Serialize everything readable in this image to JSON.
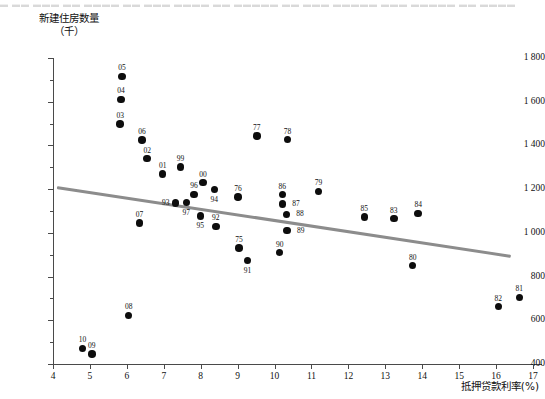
{
  "top_cutoff_text": "▬ ▬▬ ▬▬▬ ▬▬  ▬▬▬▬ ▬▬ ▬▬▬ ▬▬▬▬ ▬▬ ▬▬▬▬▬ ▬▬ ▬▬▬ ▬▬▬▬▬ ▬▬▬ ▬▬▬▬▬ ▬▬  ▬▬▬▬",
  "chart_data": {
    "type": "scatter",
    "title": "",
    "ylabel_line1": "新建住房数量",
    "ylabel_line2": "（千）",
    "xlabel": "抵押贷款利率(%)",
    "xlim": [
      4,
      17
    ],
    "ylim": [
      400,
      1800
    ],
    "xticks": [
      "4",
      "5",
      "6",
      "7",
      "8",
      "9",
      "10",
      "11",
      "12",
      "13",
      "14",
      "15",
      "16",
      "17"
    ],
    "yticks": [
      "400",
      "600",
      "800",
      "1 000",
      "1 200",
      "1 400",
      "1 600",
      "1 800"
    ],
    "yminor_step": 100,
    "grid": false,
    "legend": "none",
    "point_label_field": "year",
    "trendline": {
      "x0": 4.1,
      "y0": 1215,
      "x1": 16.4,
      "y1": 900,
      "color": "#8c8c8c"
    },
    "point_color": "#0d0d0d",
    "points": [
      {
        "year": "05",
        "x": 5.87,
        "y": 1716,
        "lab": "above"
      },
      {
        "year": "04",
        "x": 5.84,
        "y": 1611,
        "lab": "above"
      },
      {
        "year": "03",
        "x": 5.82,
        "y": 1499,
        "lab": "above"
      },
      {
        "year": "06",
        "x": 6.41,
        "y": 1424,
        "lab": "above"
      },
      {
        "year": "02",
        "x": 6.55,
        "y": 1340,
        "lab": "above"
      },
      {
        "year": "01",
        "x": 6.97,
        "y": 1270,
        "lab": "above"
      },
      {
        "year": "99",
        "x": 7.45,
        "y": 1301,
        "lab": "above"
      },
      {
        "year": "00",
        "x": 8.06,
        "y": 1230,
        "lab": "above"
      },
      {
        "year": "96",
        "x": 7.82,
        "y": 1176,
        "lab": "above"
      },
      {
        "year": "94",
        "x": 8.37,
        "y": 1198,
        "lab": "below"
      },
      {
        "year": "76",
        "x": 9.01,
        "y": 1164,
        "lab": "above"
      },
      {
        "year": "93",
        "x": 7.32,
        "y": 1136,
        "lab": "left"
      },
      {
        "year": "97",
        "x": 7.61,
        "y": 1138,
        "lab": "below"
      },
      {
        "year": "95",
        "x": 7.99,
        "y": 1076,
        "lab": "below"
      },
      {
        "year": "92",
        "x": 8.41,
        "y": 1030,
        "lab": "above"
      },
      {
        "year": "75",
        "x": 9.04,
        "y": 931,
        "lab": "above"
      },
      {
        "year": "91",
        "x": 9.27,
        "y": 873,
        "lab": "below"
      },
      {
        "year": "90",
        "x": 10.14,
        "y": 910,
        "lab": "above"
      },
      {
        "year": "86",
        "x": 10.21,
        "y": 1175,
        "lab": "above"
      },
      {
        "year": "87",
        "x": 10.21,
        "y": 1132,
        "lab": "right"
      },
      {
        "year": "88",
        "x": 10.32,
        "y": 1085,
        "lab": "right"
      },
      {
        "year": "89",
        "x": 10.34,
        "y": 1010,
        "lab": "right"
      },
      {
        "year": "77",
        "x": 9.52,
        "y": 1443,
        "lab": "above"
      },
      {
        "year": "78",
        "x": 10.35,
        "y": 1427,
        "lab": "above"
      },
      {
        "year": "79",
        "x": 11.19,
        "y": 1190,
        "lab": "above"
      },
      {
        "year": "85",
        "x": 12.43,
        "y": 1072,
        "lab": "above"
      },
      {
        "year": "83",
        "x": 13.23,
        "y": 1065,
        "lab": "above"
      },
      {
        "year": "84",
        "x": 13.89,
        "y": 1089,
        "lab": "above"
      },
      {
        "year": "80",
        "x": 13.74,
        "y": 850,
        "lab": "above"
      },
      {
        "year": "82",
        "x": 16.06,
        "y": 663,
        "lab": "above"
      },
      {
        "year": "81",
        "x": 16.63,
        "y": 705,
        "lab": "above"
      },
      {
        "year": "07",
        "x": 6.34,
        "y": 1046,
        "lab": "above"
      },
      {
        "year": "08",
        "x": 6.05,
        "y": 622,
        "lab": "above"
      },
      {
        "year": "10",
        "x": 4.8,
        "y": 471,
        "lab": "above"
      },
      {
        "year": "09",
        "x": 5.05,
        "y": 445,
        "lab": "above"
      }
    ]
  }
}
